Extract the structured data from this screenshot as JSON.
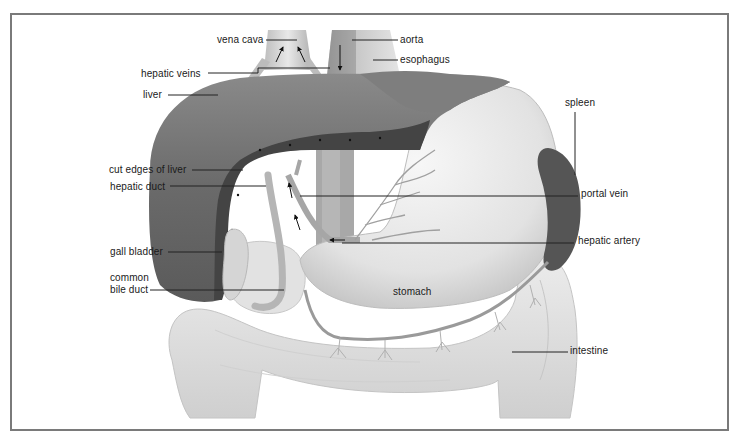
{
  "figure": {
    "labels": {
      "vena_cava": "vena cava",
      "aorta": "aorta",
      "esophagus": "esophagus",
      "hepatic_veins": "hepatic veins",
      "liver": "liver",
      "spleen": "spleen",
      "cut_edges_of_liver": "cut edges of liver",
      "hepatic_duct": "hepatic duct",
      "portal_vein": "portal vein",
      "hepatic_artery": "hepatic artery",
      "gall_bladder": "gall bladder",
      "common_bile_duct_line1": "common",
      "common_bile_duct_line2": "bile duct",
      "stomach": "stomach",
      "intestine": "intestine"
    },
    "colors": {
      "frame": "#7a7a7a",
      "liver": "#6e6e6e",
      "liver_cut": "#4a4a4a",
      "spleen": "#505050",
      "stomach": "#e4e4e4",
      "intestine": "#d8d8d8",
      "vessels": "#9a9a9a",
      "leader_lines": "#222222"
    }
  }
}
